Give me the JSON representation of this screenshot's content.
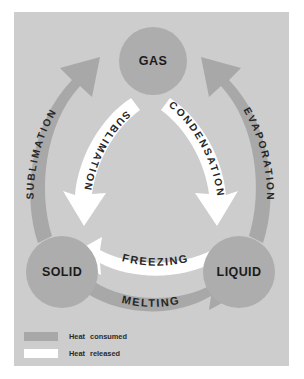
{
  "figure": {
    "panel_color": "#cdcdcd",
    "page_color": "#ffffff"
  },
  "nodes": [
    {
      "id": "gas",
      "label": "GAS",
      "cx": 153,
      "cy": 61,
      "r": 34,
      "color": "#adadad"
    },
    {
      "id": "solid",
      "label": "SOLID",
      "cx": 62,
      "cy": 272,
      "r": 36,
      "color": "#adadad"
    },
    {
      "id": "liquid",
      "label": "LIQUID",
      "cx": 239,
      "cy": 272,
      "r": 36,
      "color": "#adadad"
    }
  ],
  "arrows": [
    {
      "id": "sublimation-outer",
      "label": "SUBLIMATION",
      "heat": "consumed",
      "color": "#a8a8a8",
      "from": "solid",
      "to": "gas",
      "direction": "up",
      "side": "outer-left"
    },
    {
      "id": "sublimation-inner",
      "label": "SUBLIMATION",
      "heat": "released",
      "color": "#ffffff",
      "from": "gas",
      "to": "solid",
      "direction": "down",
      "side": "inner-left"
    },
    {
      "id": "evaporation",
      "label": "EVAPORATION",
      "heat": "consumed",
      "color": "#a8a8a8",
      "from": "liquid",
      "to": "gas",
      "direction": "up",
      "side": "outer-right"
    },
    {
      "id": "condensation",
      "label": "CONDENSATION",
      "heat": "released",
      "color": "#ffffff",
      "from": "gas",
      "to": "liquid",
      "direction": "down",
      "side": "inner-right"
    },
    {
      "id": "freezing",
      "label": "FREEZING",
      "heat": "released",
      "color": "#ffffff",
      "from": "liquid",
      "to": "solid",
      "direction": "left",
      "side": "inner-bottom"
    },
    {
      "id": "melting",
      "label": "MELTING",
      "heat": "consumed",
      "color": "#a8a8a8",
      "from": "solid",
      "to": "liquid",
      "direction": "right",
      "side": "outer-bottom"
    }
  ],
  "legend": {
    "rows": [
      {
        "id": "consumed",
        "term": "Heat",
        "qualifier": "consumed",
        "color": "#a8a8a8"
      },
      {
        "id": "released",
        "term": "Heat",
        "qualifier": "released",
        "color": "#ffffff"
      }
    ]
  }
}
